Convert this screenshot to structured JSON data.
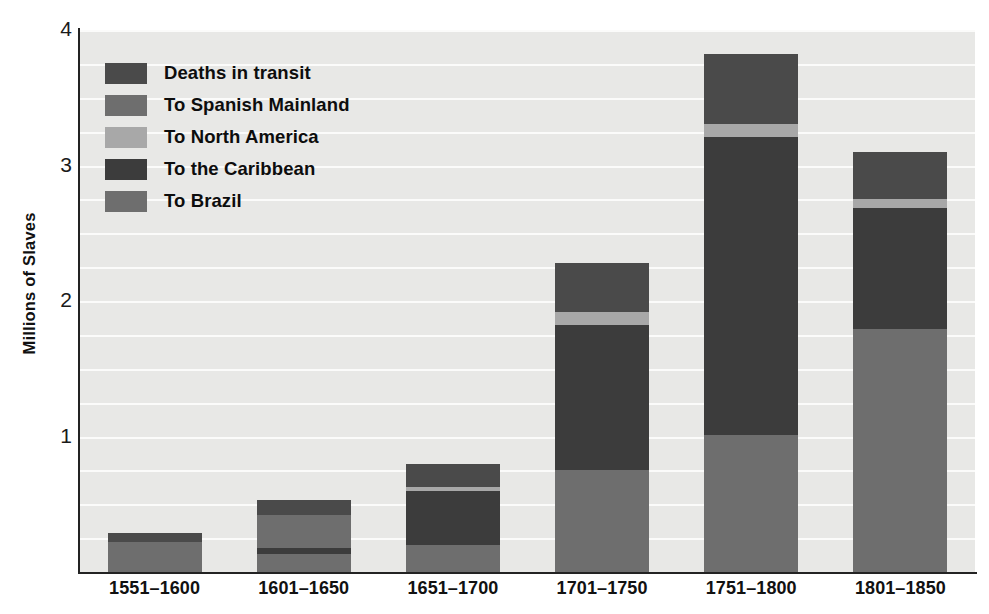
{
  "chart_data": {
    "type": "bar",
    "subtype": "stacked-vertical",
    "title": "",
    "xlabel": "",
    "ylabel": "Millions of Slaves",
    "ylim": [
      0,
      4
    ],
    "yticks": [
      1,
      2,
      3,
      4
    ],
    "ytick_labels": [
      "1",
      "2",
      "3",
      "4"
    ],
    "gridlines": {
      "visible": true,
      "interval": 0.25,
      "color": "#fbfbfa",
      "axis": "y"
    },
    "legend": {
      "position": "top-left-inside",
      "order_top_to_bottom": [
        "Deaths in transit",
        "To Spanish Mainland",
        "To North America",
        "To the Caribbean",
        "To Brazil"
      ]
    },
    "categories": [
      "1551–1600",
      "1601–1650",
      "1651–1700",
      "1701–1750",
      "1751–1800",
      "1801–1850"
    ],
    "stack_order_bottom_to_top": [
      "To Brazil",
      "To the Caribbean",
      "To North America",
      "To Spanish Mainland",
      "Deaths in transit"
    ],
    "series": [
      {
        "name": "To Brazil",
        "color": "#6e6e6e",
        "values": [
          0.0,
          0.13,
          0.2,
          0.75,
          1.01,
          1.79
        ]
      },
      {
        "name": "To the Caribbean",
        "color": "#3c3c3c",
        "values": [
          0.0,
          0.05,
          0.4,
          1.07,
          2.2,
          0.9
        ]
      },
      {
        "name": "To North America",
        "color": "#a8a8a8",
        "values": [
          0.0,
          0.0,
          0.03,
          0.1,
          0.1,
          0.06
        ]
      },
      {
        "name": "To Spanish Mainland",
        "color": "#6e6e6e",
        "values": [
          0.22,
          0.24,
          0.0,
          0.0,
          0.0,
          0.0
        ]
      },
      {
        "name": "Deaths in transit",
        "color": "#4a4a4a",
        "values": [
          0.07,
          0.11,
          0.17,
          0.36,
          0.51,
          0.35
        ]
      }
    ],
    "totals": [
      0.29,
      0.53,
      0.8,
      2.28,
      3.82,
      3.1
    ]
  },
  "legend": {
    "items": [
      {
        "label": "Deaths in transit",
        "color": "#4a4a4a"
      },
      {
        "label": "To Spanish Mainland",
        "color": "#6e6e6e"
      },
      {
        "label": "To North America",
        "color": "#a8a8a8"
      },
      {
        "label": "To the Caribbean",
        "color": "#3c3c3c"
      },
      {
        "label": "To Brazil",
        "color": "#6e6e6e"
      }
    ]
  },
  "axes": {
    "y_title": "Millions of Slaves",
    "y_ticks": [
      "4",
      "3",
      "2",
      "1"
    ],
    "x_ticks": [
      "1551–1600",
      "1601–1650",
      "1651–1700",
      "1701–1750",
      "1751–1800",
      "1801–1850"
    ]
  },
  "colors": {
    "plot_background": "#e8e8e6",
    "page_background": "#ffffff",
    "gridline": "#fbfbfa",
    "axis": "#232323",
    "text": "#111111"
  }
}
